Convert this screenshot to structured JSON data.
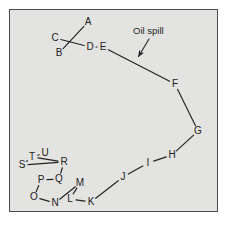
{
  "figure": {
    "kind": "oil-spill-trajectory-diagram",
    "background_color": "#e3e3e1",
    "page_color": "#ffffff",
    "border_color": "#4a4a4a",
    "ink_color": "#222222"
  },
  "annotation": {
    "text": "Oil spill",
    "x": 133,
    "y": 26,
    "arrow": {
      "x1": 149,
      "y1": 39,
      "x2": 138.5,
      "y2": 56.5
    }
  },
  "nodes": [
    {
      "label": "A",
      "x": 88,
      "y": 22
    },
    {
      "label": "B",
      "x": 59,
      "y": 53
    },
    {
      "label": "C",
      "x": 55,
      "y": 38
    },
    {
      "label": "D",
      "x": 90,
      "y": 47
    },
    {
      "label": "E",
      "x": 103,
      "y": 47
    },
    {
      "label": "F",
      "x": 175,
      "y": 84
    },
    {
      "label": "G",
      "x": 198,
      "y": 131
    },
    {
      "label": "H",
      "x": 172,
      "y": 155
    },
    {
      "label": "I",
      "x": 148,
      "y": 163
    },
    {
      "label": "J",
      "x": 123,
      "y": 177
    },
    {
      "label": "K",
      "x": 91,
      "y": 202
    },
    {
      "label": "L",
      "x": 70,
      "y": 199
    },
    {
      "label": "M",
      "x": 80,
      "y": 183
    },
    {
      "label": "N",
      "x": 55,
      "y": 203
    },
    {
      "label": "O",
      "x": 34,
      "y": 197
    },
    {
      "label": "P",
      "x": 41,
      "y": 180
    },
    {
      "label": "Q",
      "x": 59,
      "y": 179
    },
    {
      "label": "R",
      "x": 64,
      "y": 162
    },
    {
      "label": "S",
      "x": 22,
      "y": 165
    },
    {
      "label": "T",
      "x": 32,
      "y": 157
    },
    {
      "label": "U",
      "x": 45,
      "y": 153
    }
  ],
  "edges": [
    {
      "from": "A",
      "to": "B"
    },
    {
      "from": "C",
      "to": "D"
    },
    {
      "from": "D",
      "to": "E"
    },
    {
      "from": "E",
      "to": "F"
    },
    {
      "from": "F",
      "to": "G"
    },
    {
      "from": "G",
      "to": "H"
    },
    {
      "from": "H",
      "to": "I"
    },
    {
      "from": "I",
      "to": "J"
    },
    {
      "from": "J",
      "to": "K"
    },
    {
      "from": "K",
      "to": "L"
    },
    {
      "from": "L",
      "to": "M"
    },
    {
      "from": "M",
      "to": "N"
    },
    {
      "from": "N",
      "to": "O"
    },
    {
      "from": "O",
      "to": "P"
    },
    {
      "from": "P",
      "to": "Q"
    },
    {
      "from": "Q",
      "to": "R"
    },
    {
      "from": "R",
      "to": "T"
    },
    {
      "from": "T",
      "to": "U"
    },
    {
      "from": "T",
      "to": "S"
    },
    {
      "from": "S",
      "to": "R"
    }
  ]
}
